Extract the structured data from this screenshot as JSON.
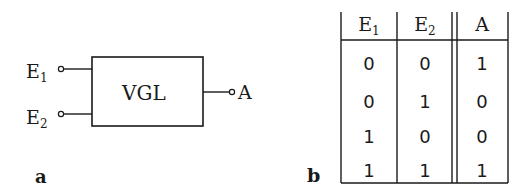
{
  "diagram_a": {
    "panel_label": "a",
    "block_label": "VGL",
    "inputs": [
      {
        "name": "E",
        "sub": "1"
      },
      {
        "name": "E",
        "sub": "2"
      }
    ],
    "output": "A"
  },
  "diagram_b": {
    "panel_label": "b",
    "headers": [
      {
        "name": "E",
        "sub": "1"
      },
      {
        "name": "E",
        "sub": "2"
      },
      {
        "name": "A",
        "sub": ""
      }
    ],
    "rows": [
      [
        "0",
        "0",
        "1"
      ],
      [
        "0",
        "1",
        "0"
      ],
      [
        "1",
        "0",
        "0"
      ],
      [
        "1",
        "1",
        "1"
      ]
    ]
  }
}
